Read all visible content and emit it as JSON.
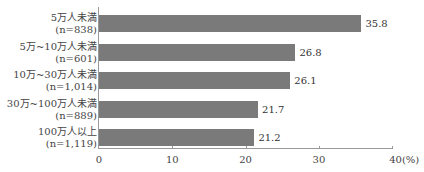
{
  "chart_data": {
    "type": "bar",
    "orientation": "horizontal",
    "title": "",
    "xlabel": "",
    "ylabel": "",
    "unit": "(%)",
    "xlim": [
      0,
      40
    ],
    "xticks": [
      0,
      10,
      20,
      30,
      40
    ],
    "xtick_labels": [
      "0",
      "10",
      "20",
      "30",
      "40(%)"
    ],
    "grid": false,
    "legend": null,
    "categories": [
      {
        "label": "5万人未満",
        "n": "(n=838)"
      },
      {
        "label": "5万~10万人未満",
        "n": "(n=601)"
      },
      {
        "label": "10万~30万人未満",
        "n": "(n=1,014)"
      },
      {
        "label": "30万~100万人未満",
        "n": "(n=889)"
      },
      {
        "label": "100万人以上",
        "n": "(n=1,119)"
      }
    ],
    "values": [
      35.8,
      26.8,
      26.1,
      21.7,
      21.2
    ],
    "value_labels": [
      "35.8",
      "26.8",
      "26.1",
      "21.7",
      "21.2"
    ],
    "bar_color": "#7a7a7a"
  }
}
